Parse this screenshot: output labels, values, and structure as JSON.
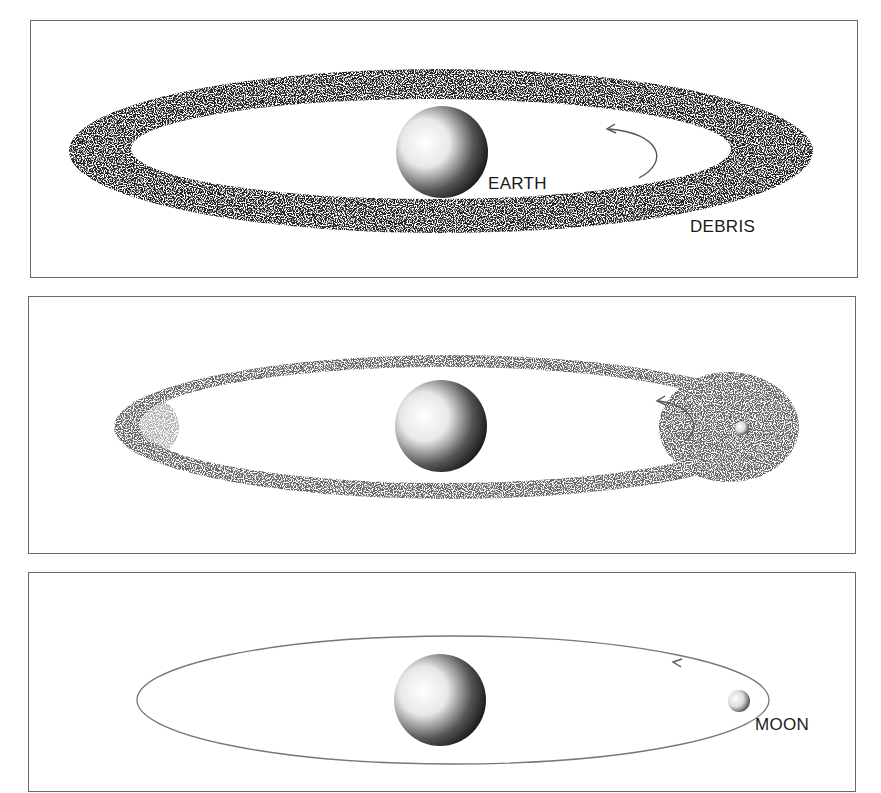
{
  "figure": {
    "panels": [
      {
        "id": "panel-1",
        "description": "Dense ring of debris orbiting Earth",
        "labels": {
          "earth": "EARTH",
          "debris": "DEBRIS"
        }
      },
      {
        "id": "panel-2",
        "description": "Debris coalescing into a small moon",
        "labels": {}
      },
      {
        "id": "panel-3",
        "description": "Moon in elliptical orbit around Earth",
        "labels": {
          "moon": "MOON"
        }
      }
    ]
  }
}
